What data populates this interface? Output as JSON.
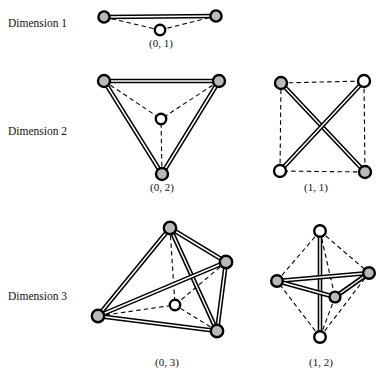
{
  "figure": {
    "title": "",
    "background_color": "#ffffff",
    "node_fill_gray": "#b9b9b9",
    "node_fill_white": "#ffffff",
    "node_stroke": "#000000",
    "edge_color": "#000000"
  },
  "row_labels": [
    {
      "id": "dimension-1",
      "text": "Dimension 1",
      "x": 8,
      "y": 27
    },
    {
      "id": "dimension-2",
      "text": "Dimension 2",
      "x": 8,
      "y": 135
    },
    {
      "id": "dimension-3",
      "text": "Dimension 3",
      "x": 8,
      "y": 300
    }
  ],
  "captions": [
    {
      "id": "caption-0-1",
      "text": "(0, 1)",
      "x": 161,
      "y": 47
    },
    {
      "id": "caption-0-2",
      "text": "(0, 2)",
      "x": 162,
      "y": 191
    },
    {
      "id": "caption-1-1",
      "text": "(1, 1)",
      "x": 316,
      "y": 191
    },
    {
      "id": "caption-0-3",
      "text": "(0, 3)",
      "x": 167,
      "y": 366
    },
    {
      "id": "caption-1-2",
      "text": "(1, 2)",
      "x": 321,
      "y": 366
    }
  ],
  "diagrams": [
    {
      "id": "diagram-0-1",
      "label": "(0, 1)",
      "dimension": 1,
      "node_count": 3,
      "nodes": [
        {
          "name": "vertex-left",
          "x": 104,
          "y": 17,
          "r": 5.6,
          "fill": "gray"
        },
        {
          "name": "vertex-center",
          "x": 160,
          "y": 30,
          "r": 5.2,
          "fill": "white"
        },
        {
          "name": "vertex-right",
          "x": 216,
          "y": 16,
          "r": 5.6,
          "fill": "gray"
        }
      ],
      "solid_edges": [
        [
          0,
          2
        ]
      ],
      "dashed_edges": [
        [
          0,
          1
        ],
        [
          1,
          2
        ]
      ]
    },
    {
      "id": "diagram-0-2",
      "label": "(0, 2)",
      "dimension": 2,
      "node_count": 4,
      "nodes": [
        {
          "name": "vertex-top-left",
          "x": 104,
          "y": 81,
          "r": 6.0,
          "fill": "gray"
        },
        {
          "name": "vertex-top-right",
          "x": 219,
          "y": 81,
          "r": 6.0,
          "fill": "gray"
        },
        {
          "name": "vertex-bottom",
          "x": 162,
          "y": 174,
          "r": 6.0,
          "fill": "gray"
        },
        {
          "name": "vertex-center",
          "x": 161,
          "y": 119,
          "r": 5.2,
          "fill": "white"
        }
      ],
      "solid_edges": [
        [
          0,
          1
        ],
        [
          0,
          2
        ],
        [
          1,
          2
        ]
      ],
      "dashed_edges": [
        [
          0,
          3
        ],
        [
          1,
          3
        ],
        [
          2,
          3
        ]
      ]
    },
    {
      "id": "diagram-1-1",
      "label": "(1, 1)",
      "dimension": 2,
      "node_count": 4,
      "nodes": [
        {
          "name": "vertex-top-left",
          "x": 281,
          "y": 83,
          "r": 6.0,
          "fill": "gray"
        },
        {
          "name": "vertex-top-right",
          "x": 364,
          "y": 81,
          "r": 6.0,
          "fill": "white"
        },
        {
          "name": "vertex-bottom-right",
          "x": 365,
          "y": 172,
          "r": 6.0,
          "fill": "gray"
        },
        {
          "name": "vertex-bottom-left",
          "x": 280,
          "y": 171,
          "r": 6.0,
          "fill": "white"
        }
      ],
      "solid_edges": [
        [
          0,
          2
        ],
        [
          1,
          3
        ]
      ],
      "dashed_edges": [
        [
          0,
          1
        ],
        [
          1,
          2
        ],
        [
          2,
          3
        ],
        [
          3,
          0
        ]
      ]
    },
    {
      "id": "diagram-0-3",
      "label": "(0, 3)",
      "dimension": 3,
      "node_count": 5,
      "nodes": [
        {
          "name": "vertex-apex",
          "x": 170,
          "y": 228,
          "r": 6.2,
          "fill": "gray"
        },
        {
          "name": "vertex-right",
          "x": 226,
          "y": 262,
          "r": 6.2,
          "fill": "gray"
        },
        {
          "name": "vertex-left",
          "x": 98,
          "y": 316,
          "r": 6.2,
          "fill": "gray"
        },
        {
          "name": "vertex-bottom-right",
          "x": 217,
          "y": 331,
          "r": 6.2,
          "fill": "gray"
        },
        {
          "name": "vertex-center",
          "x": 175,
          "y": 305,
          "r": 5.2,
          "fill": "white"
        }
      ],
      "solid_edges": [
        [
          0,
          1
        ],
        [
          0,
          2
        ],
        [
          0,
          3
        ],
        [
          1,
          2
        ],
        [
          1,
          3
        ],
        [
          2,
          3
        ]
      ],
      "dashed_edges": [
        [
          0,
          4
        ],
        [
          1,
          4
        ],
        [
          2,
          4
        ],
        [
          3,
          4
        ]
      ]
    },
    {
      "id": "diagram-1-2",
      "label": "(1, 2)",
      "dimension": 3,
      "node_count": 5,
      "nodes": [
        {
          "name": "vertex-top",
          "x": 320,
          "y": 231,
          "r": 5.8,
          "fill": "white"
        },
        {
          "name": "vertex-bottom",
          "x": 320,
          "y": 337,
          "r": 5.8,
          "fill": "white"
        },
        {
          "name": "vertex-left",
          "x": 277,
          "y": 281,
          "r": 5.8,
          "fill": "gray"
        },
        {
          "name": "vertex-right",
          "x": 369,
          "y": 273,
          "r": 5.8,
          "fill": "gray"
        },
        {
          "name": "vertex-front",
          "x": 335,
          "y": 297,
          "r": 5.4,
          "fill": "gray"
        }
      ],
      "solid_edges": [
        [
          0,
          1
        ],
        [
          2,
          3
        ],
        [
          2,
          4
        ],
        [
          3,
          4
        ]
      ],
      "dashed_edges": [
        [
          0,
          2
        ],
        [
          0,
          3
        ],
        [
          0,
          4
        ],
        [
          1,
          2
        ],
        [
          1,
          3
        ],
        [
          1,
          4
        ]
      ]
    }
  ],
  "chart_data": {
    "type": "diagram",
    "title": "",
    "description_rows": [
      "Dimension 1",
      "Dimension 2",
      "Dimension 3"
    ],
    "items": [
      {
        "label": "(0, 1)",
        "row": "Dimension 1",
        "nodes": 3,
        "solid_edges": 1,
        "dashed_edges": 2
      },
      {
        "label": "(0, 2)",
        "row": "Dimension 2",
        "nodes": 4,
        "solid_edges": 3,
        "dashed_edges": 3
      },
      {
        "label": "(1, 1)",
        "row": "Dimension 2",
        "nodes": 4,
        "solid_edges": 2,
        "dashed_edges": 4
      },
      {
        "label": "(0, 3)",
        "row": "Dimension 3",
        "nodes": 5,
        "solid_edges": 6,
        "dashed_edges": 4
      },
      {
        "label": "(1, 2)",
        "row": "Dimension 3",
        "nodes": 5,
        "solid_edges": 4,
        "dashed_edges": 6
      }
    ]
  }
}
